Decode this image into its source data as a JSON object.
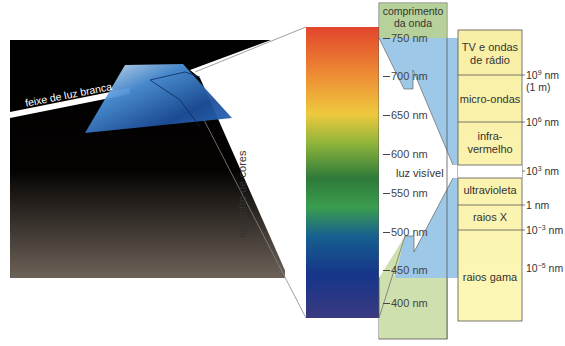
{
  "beam_label": "feixe de luz branca",
  "spectrum_label": "espectro de cores",
  "wavelength_header": [
    "comprimento",
    "da onda"
  ],
  "visible_label": "luz visível",
  "wavelengths": [
    "750 nm",
    "700 nm",
    "650 nm",
    "600 nm",
    "550 nm",
    "500 nm",
    "450 nm",
    "400 nm"
  ],
  "bands": [
    {
      "label_1": "TV e ondas",
      "label_2": "de rádio"
    },
    {
      "label_1": "micro-ondas",
      "label_2": ""
    },
    {
      "label_1": "infra-",
      "label_2": "vermelho"
    },
    {
      "label_1": "ultravioleta",
      "label_2": ""
    },
    {
      "label_1": "raios X",
      "label_2": ""
    },
    {
      "label_1": "raios gama",
      "label_2": ""
    }
  ],
  "boundaries": [
    {
      "base": "10",
      "exp": "9",
      "unit": " nm",
      "note": "(1 m)"
    },
    {
      "base": "10",
      "exp": "6",
      "unit": " nm",
      "note": ""
    },
    {
      "base": "10",
      "exp": "3",
      "unit": " nm",
      "note": ""
    },
    {
      "base": "1",
      "exp": "",
      "unit": " nm",
      "note": ""
    },
    {
      "base": "10",
      "exp": "−3",
      "unit": " nm",
      "note": ""
    },
    {
      "base": "10",
      "exp": "−5",
      "unit": " nm",
      "note": ""
    }
  ],
  "colors": {
    "header_green": "#b7d19a",
    "column_green": "#cde0ae",
    "visible_blue": "#9ec8e8",
    "band_yellow": "#fbf5b0",
    "prism_blue": "#2f6fb8"
  }
}
